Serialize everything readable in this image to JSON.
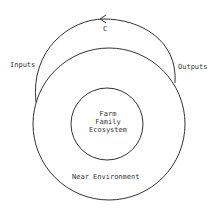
{
  "diagram": {
    "cycle_label": "C",
    "inputs_label": "Inputs",
    "outputs_label": "Outputs",
    "core": {
      "line1": "Farm",
      "line2": "Family",
      "line3": "Ecosystem"
    },
    "ring_label": "Near Environment",
    "colors": {
      "stroke": "#333333",
      "background": "#ffffff"
    }
  }
}
